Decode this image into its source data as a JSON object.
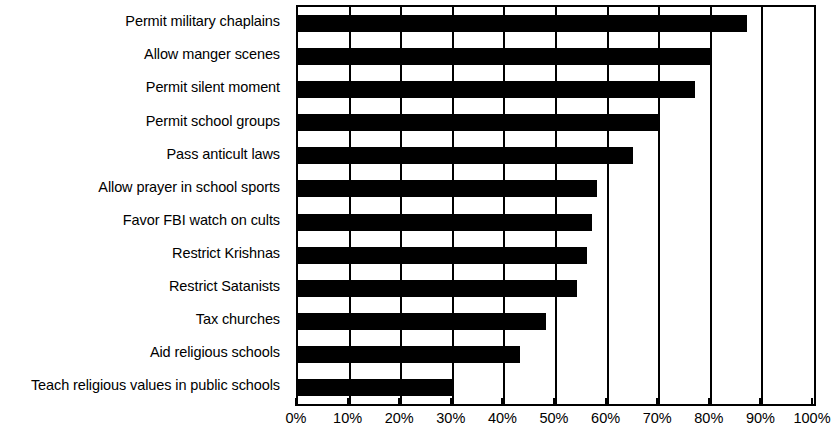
{
  "chart_data": {
    "type": "bar",
    "orientation": "horizontal",
    "title": "",
    "subtitle": "",
    "xlabel": "",
    "ylabel": "",
    "xlim": [
      0,
      100
    ],
    "xtick_labels": [
      "0%",
      "10%",
      "20%",
      "30%",
      "40%",
      "50%",
      "60%",
      "70%",
      "80%",
      "90%",
      "100%"
    ],
    "xtick_values": [
      0,
      10,
      20,
      30,
      40,
      50,
      60,
      70,
      80,
      90,
      100
    ],
    "grid": true,
    "grid_axis": "x",
    "legend": false,
    "bar_color": "#000000",
    "background_color": "#ffffff",
    "axis_color": "#000000",
    "categories": [
      "Permit military chaplains",
      "Allow manger scenes",
      "Permit silent moment",
      "Permit school groups",
      "Pass anticult laws",
      "Allow prayer in school sports",
      "Favor FBI watch on cults",
      "Restrict Krishnas",
      "Restrict Satanists",
      "Tax churches",
      "Aid religious schools",
      "Teach religious values in public schools"
    ],
    "values": [
      87,
      80,
      77,
      70,
      65,
      58,
      57,
      56,
      54,
      48,
      43,
      30
    ]
  }
}
